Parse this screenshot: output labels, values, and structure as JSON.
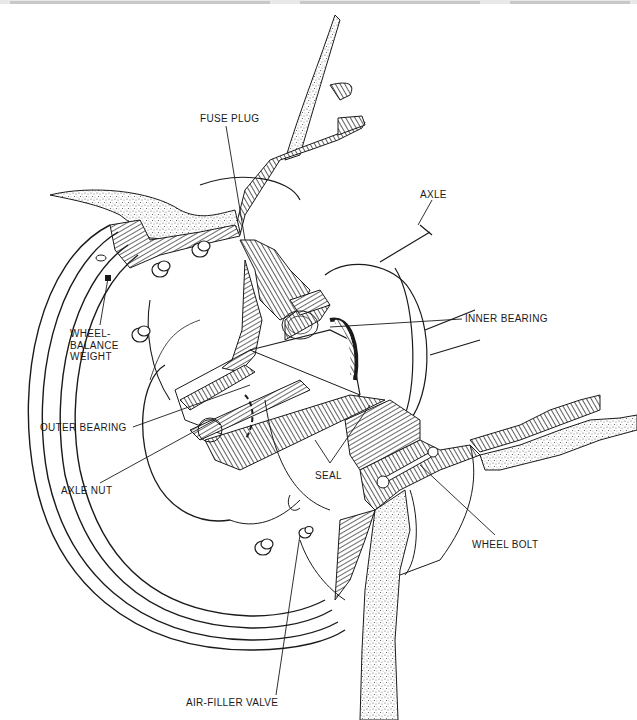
{
  "diagram": {
    "labels": [
      {
        "id": "fuse-plug",
        "text": "FUSE PLUG",
        "x": 200,
        "y": 118
      },
      {
        "id": "axle",
        "text": "AXLE",
        "x": 420,
        "y": 193
      },
      {
        "id": "inner-bearing",
        "text": "INNER BEARING",
        "x": 465,
        "y": 315
      },
      {
        "id": "wheel-balance-weight",
        "text": "WHEEL-\nBALANCE\nWEIGHT",
        "x": 70,
        "y": 330
      },
      {
        "id": "outer-bearing",
        "text": "OUTER BEARING",
        "x": 40,
        "y": 423
      },
      {
        "id": "axle-nut",
        "text": "AXLE NUT",
        "x": 60,
        "y": 487
      },
      {
        "id": "seal",
        "text": "SEAL",
        "x": 315,
        "y": 472
      },
      {
        "id": "wheel-bolt",
        "text": "WHEEL BOLT",
        "x": 472,
        "y": 541
      },
      {
        "id": "air-filler-valve",
        "text": "AIR-FILLER VALVE",
        "x": 185,
        "y": 699
      }
    ],
    "caption": "..."
  },
  "colors": {
    "ink": "#1a1a1a",
    "paper": "#ffffff",
    "stipple": "#555555"
  }
}
